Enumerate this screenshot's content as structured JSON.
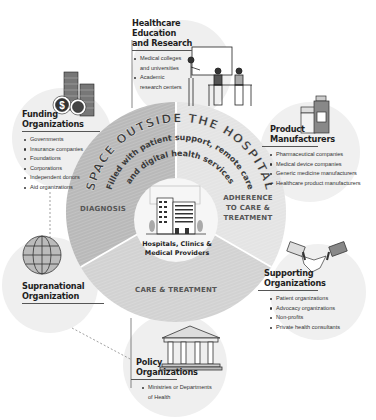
{
  "diagram": {
    "arc_title": "SPACE OUTSIDE THE HOSPITAL",
    "arc_subtitle_line1": "Filled with patient support, remote care",
    "arc_subtitle_line2": "and digital health services",
    "center": {
      "label_line1": "Hospitals, Clinics &",
      "label_line2": "Medical Providers",
      "icon": "hospital-building-icon"
    },
    "sectors": [
      {
        "id": "diagnosis",
        "label_lines": [
          "DIAGNOSIS"
        ],
        "color": "#b9b9b9"
      },
      {
        "id": "adherence",
        "label_lines": [
          "ADHERENCE",
          "TO CARE &",
          "TREATMENT"
        ],
        "color": "#e4e4e4"
      },
      {
        "id": "care",
        "label_lines": [
          "CARE & TREATMENT"
        ],
        "color": "#d2d2d2"
      }
    ],
    "stakeholders": [
      {
        "id": "education",
        "title_lines": [
          "Healthcare Education",
          "and Research"
        ],
        "icon": "classroom-teacher-icon",
        "items": [
          {
            "text": "Medical colleges",
            "cont": false
          },
          {
            "text": "and universities",
            "cont": true
          },
          {
            "text": "Academic",
            "cont": false
          },
          {
            "text": "research centers",
            "cont": true
          }
        ]
      },
      {
        "id": "funding",
        "title_lines": [
          "Funding",
          "Organizations"
        ],
        "icon": "coins-dollar-icon",
        "items": [
          {
            "text": "Governments",
            "cont": false
          },
          {
            "text": "Insurance companies",
            "cont": false
          },
          {
            "text": "Foundations",
            "cont": false
          },
          {
            "text": "Corporations",
            "cont": false
          },
          {
            "text": "Independent donors",
            "cont": false
          },
          {
            "text": "Aid organizations",
            "cont": false
          }
        ]
      },
      {
        "id": "product",
        "title_lines": [
          "Product",
          "Manufacturers"
        ],
        "icon": "medicine-bottles-icon",
        "items": [
          {
            "text": "Pharmaceutical companies",
            "cont": false
          },
          {
            "text": "Medical device companies",
            "cont": false
          },
          {
            "text": "Generic medicine manufacturers",
            "cont": false
          },
          {
            "text": "Healthcare product manufacturers",
            "cont": false
          }
        ]
      },
      {
        "id": "supporting",
        "title_lines": [
          "Supporting",
          "Organizations"
        ],
        "icon": "handshake-icon",
        "items": [
          {
            "text": "Patient organizations",
            "cont": false
          },
          {
            "text": "Advocacy organizations",
            "cont": false
          },
          {
            "text": "Non-profits",
            "cont": false
          },
          {
            "text": "Private health consultants",
            "cont": false
          }
        ]
      },
      {
        "id": "supranational",
        "title_lines": [
          "Supranational",
          "Organization"
        ],
        "icon": "globe-icon",
        "items": []
      },
      {
        "id": "policy",
        "title_lines": [
          "Policy",
          "Organizations"
        ],
        "icon": "government-building-icon",
        "items": [
          {
            "text": "Ministries or Departments",
            "cont": false
          },
          {
            "text": "of Health",
            "cont": true
          }
        ]
      }
    ],
    "colors": {
      "satellite_circle": "#efefef",
      "center_circle": "#f7f7f7",
      "text_dark": "#1e1e1e",
      "arc_text": "#3a3a3a"
    }
  }
}
